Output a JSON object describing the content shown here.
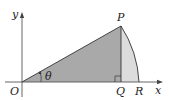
{
  "diagram": {
    "labels": {
      "y_axis": "y",
      "x_axis": "x",
      "origin": "O",
      "point_p": "P",
      "point_q": "Q",
      "point_r": "R",
      "angle": "θ"
    },
    "colors": {
      "triangle_fill": "#a9a9a9",
      "segment_fill": "#dcdcdc",
      "stroke": "#333333",
      "axis": "#555555"
    },
    "points": {
      "O": [
        22,
        82
      ],
      "P": [
        121,
        26
      ],
      "Q": [
        121,
        82
      ],
      "R": [
        139,
        82
      ]
    }
  }
}
